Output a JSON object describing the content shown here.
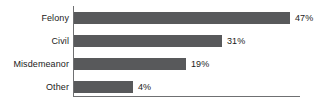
{
  "chart_data": {
    "type": "bar",
    "orientation": "horizontal",
    "title": "",
    "subtitle": "",
    "xlabel": "",
    "ylabel": "",
    "categories": [
      "Felony",
      "Civil",
      "Misdemeanor",
      "Other"
    ],
    "values": [
      47,
      31,
      19,
      4
    ],
    "value_labels": [
      "47%",
      "31%",
      "19%",
      "4%"
    ],
    "units": "percent",
    "xlim": [
      0,
      47
    ],
    "grid": false,
    "legend": null,
    "legend_position": "none",
    "tick_labels": [],
    "annotations": [],
    "colors": {
      "bar": "#58595B",
      "axis": "#6F7072",
      "text": "#1B1B1B",
      "background": "#FFFFFF"
    },
    "bars": [
      {
        "category": "Felony",
        "value": 47,
        "label": "47%",
        "bar_px": 216,
        "top_px": 12
      },
      {
        "category": "Civil",
        "value": 31,
        "label": "31%",
        "bar_px": 148,
        "top_px": 35
      },
      {
        "category": "Misdemeanor",
        "value": 19,
        "label": "19%",
        "bar_px": 112,
        "top_px": 58
      },
      {
        "category": "Other",
        "value": 4,
        "label": "4%",
        "bar_px": 59,
        "top_px": 81
      }
    ]
  }
}
